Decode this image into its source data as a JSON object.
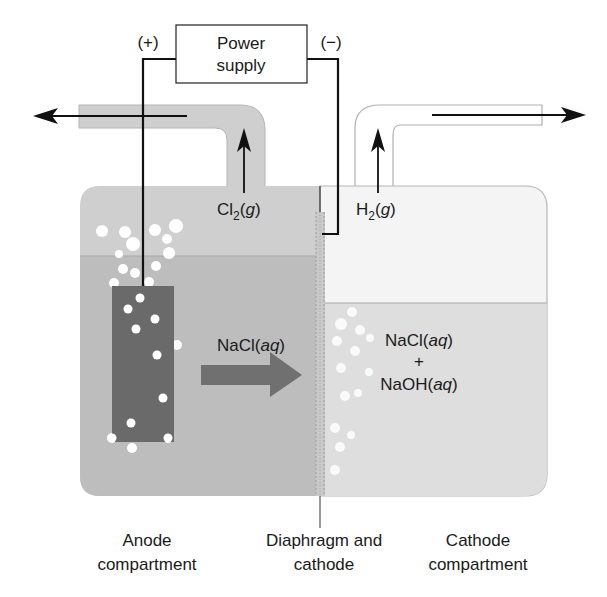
{
  "power_supply": {
    "line1": "Power",
    "line2": "supply",
    "positive_terminal": "(+)",
    "negative_terminal": "(−)"
  },
  "gases": {
    "anode_gas_main": "Cl",
    "anode_gas_sub": "2",
    "anode_gas_state": "g",
    "cathode_gas_main": "H",
    "cathode_gas_sub": "2",
    "cathode_gas_state": "g"
  },
  "solutions": {
    "anode_solution_main": "NaCl(",
    "anode_solution_state": "aq",
    "cathode_line1_main": "NaCl(",
    "cathode_line1_state": "aq",
    "cathode_plus": "+",
    "cathode_line2_main": "NaOH(",
    "cathode_line2_state": "aq",
    "close_paren": ")"
  },
  "labels": {
    "anode_line1": "Anode",
    "anode_line2": "compartment",
    "diaphragm_line1": "Diaphragm and",
    "diaphragm_line2": "cathode",
    "cathode_line1": "Cathode",
    "cathode_line2": "compartment"
  },
  "colors": {
    "anode_gas_space": "#cfcfcf",
    "anode_liquid": "#bdbdbd",
    "cathode_gas_space": "#f4f4f4",
    "cathode_liquid": "#dedede",
    "electrode": "#6a6a6a",
    "flow_arrow": "#707070",
    "wire": "#111111"
  }
}
